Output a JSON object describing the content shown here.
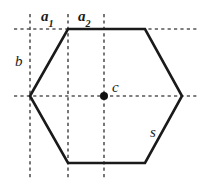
{
  "figure": {
    "shape": "hexagon",
    "stroke_color": "#1a1a1a",
    "dash_color": "#555555",
    "background": "#ffffff",
    "labels": {
      "a1_base": "a",
      "a1_sub": "1",
      "a2_base": "a",
      "a2_sub": "2",
      "b": "b",
      "c": "c",
      "s": "s"
    },
    "geometry": {
      "hexagon_vertices": [
        [
          30,
          96
        ],
        [
          68,
          29
        ],
        [
          145,
          29
        ],
        [
          182,
          96
        ],
        [
          145,
          163
        ],
        [
          68,
          163
        ]
      ],
      "center_point": [
        104,
        96
      ],
      "center_dot_radius": 4,
      "vertical_dashed_lines_x": [
        30,
        68,
        104
      ],
      "vertical_dashed_extent_y": [
        14,
        180
      ],
      "horizontal_dashed_lines_y": [
        29,
        96
      ],
      "horizontal_dashed_extent_x": [
        14,
        198
      ]
    }
  }
}
